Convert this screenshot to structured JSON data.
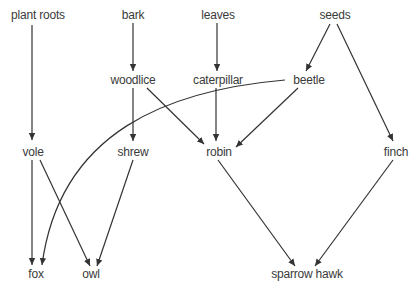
{
  "diagram": {
    "type": "food-web",
    "line_color": "#333333",
    "text_color": "#3a3a3a",
    "nodes": [
      {
        "id": "plant_roots",
        "label": "plant roots",
        "x": 38,
        "y": 8
      },
      {
        "id": "bark",
        "label": "bark",
        "x": 133,
        "y": 8
      },
      {
        "id": "leaves",
        "label": "leaves",
        "x": 218,
        "y": 8
      },
      {
        "id": "seeds",
        "label": "seeds",
        "x": 335,
        "y": 8
      },
      {
        "id": "woodlice",
        "label": "woodlice",
        "x": 133,
        "y": 73
      },
      {
        "id": "caterpillar",
        "label": "caterpillar",
        "x": 218,
        "y": 73
      },
      {
        "id": "beetle",
        "label": "beetle",
        "x": 309,
        "y": 73
      },
      {
        "id": "vole",
        "label": "vole",
        "x": 33,
        "y": 145
      },
      {
        "id": "shrew",
        "label": "shrew",
        "x": 133,
        "y": 145
      },
      {
        "id": "robin",
        "label": "robin",
        "x": 219,
        "y": 145
      },
      {
        "id": "finch",
        "label": "finch",
        "x": 396,
        "y": 145
      },
      {
        "id": "fox",
        "label": "fox",
        "x": 36,
        "y": 267
      },
      {
        "id": "owl",
        "label": "owl",
        "x": 91,
        "y": 267
      },
      {
        "id": "sparrow_hawk",
        "label": "sparrow hawk",
        "x": 307,
        "y": 267
      }
    ],
    "edges": [
      {
        "from": "plant_roots",
        "to": "vole"
      },
      {
        "from": "bark",
        "to": "woodlice"
      },
      {
        "from": "leaves",
        "to": "caterpillar"
      },
      {
        "from": "seeds",
        "to": "beetle"
      },
      {
        "from": "seeds",
        "to": "finch"
      },
      {
        "from": "woodlice",
        "to": "shrew"
      },
      {
        "from": "woodlice",
        "to": "robin"
      },
      {
        "from": "caterpillar",
        "to": "robin"
      },
      {
        "from": "beetle",
        "to": "robin"
      },
      {
        "from": "beetle",
        "to": "fox"
      },
      {
        "from": "vole",
        "to": "fox"
      },
      {
        "from": "vole",
        "to": "owl"
      },
      {
        "from": "shrew",
        "to": "owl"
      },
      {
        "from": "robin",
        "to": "sparrow_hawk"
      },
      {
        "from": "finch",
        "to": "sparrow_hawk"
      }
    ]
  }
}
